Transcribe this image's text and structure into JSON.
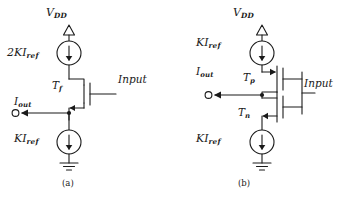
{
  "figure": {
    "type": "circuit-schematic",
    "line_color": "#1a1a1a",
    "background_color": "#ffffff"
  },
  "circuit_a": {
    "caption": "(a)",
    "supply_label": "V",
    "supply_sub": "DD",
    "top_source_label": "2KI",
    "top_source_sub": "ref",
    "transistor_label": "T",
    "transistor_sub": "f",
    "input_label": "Input",
    "output_label": "I",
    "output_sub": "out",
    "bottom_source_label": "KI",
    "bottom_source_sub": "ref"
  },
  "circuit_b": {
    "caption": "(b)",
    "supply_label": "V",
    "supply_sub": "DD",
    "top_source_label": "KI",
    "top_source_sub": "ref",
    "pmos_label": "T",
    "pmos_sub": "p",
    "nmos_label": "T",
    "nmos_sub": "n",
    "input_label": "Input",
    "output_label": "I",
    "output_sub": "out",
    "bottom_source_label": "KI",
    "bottom_source_sub": "ref"
  }
}
